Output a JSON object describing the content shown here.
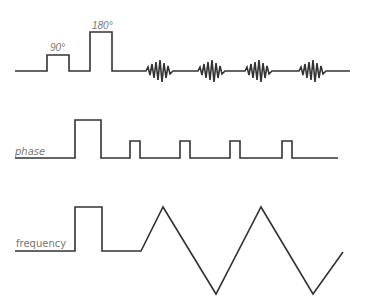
{
  "diagram": {
    "type": "pulse-sequence",
    "rows": [
      {
        "name": "rf",
        "label": "",
        "pulse_labels": [
          "90°",
          "180°"
        ],
        "echoes": 4
      },
      {
        "name": "phase",
        "label": "phase",
        "small_pulses": 4
      },
      {
        "name": "frequency",
        "label": "frequency",
        "pattern": "triangle-readout"
      }
    ],
    "line_color": "#333333",
    "label_color": "#777777"
  }
}
